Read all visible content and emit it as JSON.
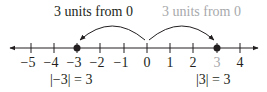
{
  "diagram": {
    "type": "number-line",
    "colors": {
      "ink": "#231f20",
      "highlight_gray": "#a7a9ac"
    },
    "tick_labels": [
      "−5",
      "−4",
      "−3",
      "−2",
      "−1",
      "0",
      "1",
      "2",
      "3",
      "4"
    ],
    "points": [
      {
        "value": -3,
        "label": "−3"
      },
      {
        "value": 3,
        "label": "3"
      }
    ],
    "annotations": {
      "left_arc_label": "3 units from 0",
      "right_arc_label": "3 units from 0",
      "left_equation": "|−3| = 3",
      "right_equation": "|3| = 3"
    }
  }
}
